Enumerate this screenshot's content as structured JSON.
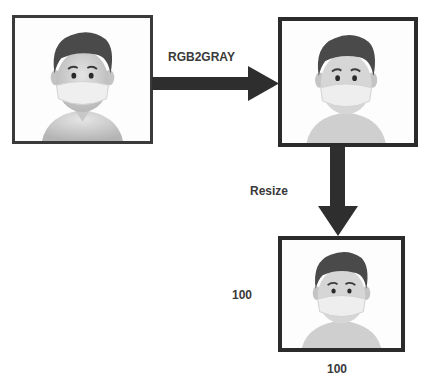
{
  "diagram": {
    "nodes": [
      {
        "id": "original",
        "label": "",
        "description": "avatar image with mask (original)"
      },
      {
        "id": "gray",
        "label": "",
        "description": "avatar image with mask (grayscale)"
      },
      {
        "id": "resized",
        "label": "",
        "description": "avatar image with mask (resized)"
      }
    ],
    "edges": [
      {
        "from": "original",
        "to": "gray",
        "label": "RGB2GRAY"
      },
      {
        "from": "gray",
        "to": "resized",
        "label": "Resize"
      }
    ],
    "dimensions": {
      "height": "100",
      "width": "100"
    }
  },
  "colors": {
    "border": "#2b2b2b",
    "arrow": "#2e2e2e",
    "text": "#3a3a3a"
  }
}
